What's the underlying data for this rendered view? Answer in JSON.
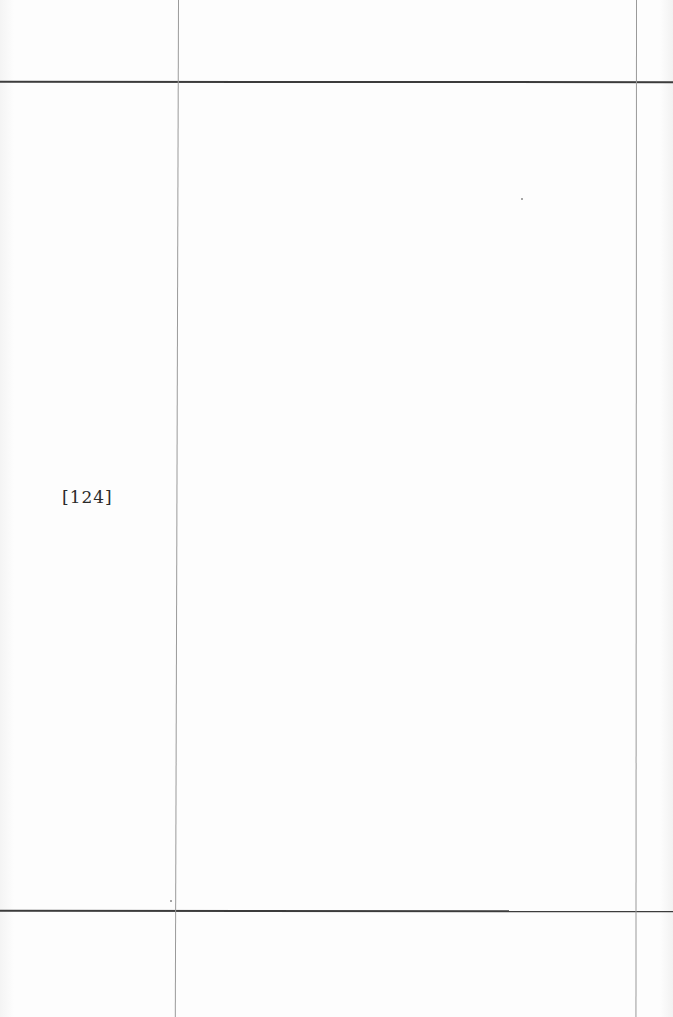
{
  "document": {
    "page_label": "[124]",
    "type": "blank ledger page"
  },
  "colors": {
    "paper": "#fbfbfb",
    "rule_horizontal": "#3c3c3c",
    "rule_vertical": "#9a9a9a",
    "text": "#2a2a2a"
  }
}
